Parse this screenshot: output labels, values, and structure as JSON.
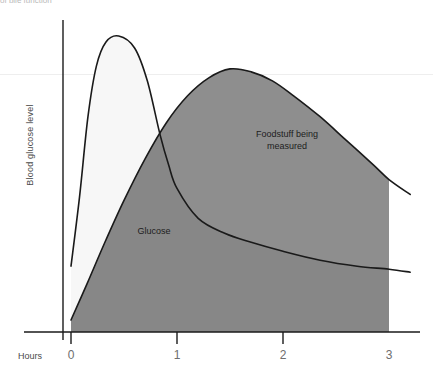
{
  "header": {
    "clipped_text": "of bile function"
  },
  "chart_data": {
    "type": "area",
    "title": "",
    "xlabel": "Hours",
    "ylabel": "Blood glucose level",
    "xlim": [
      -0.08,
      3.2
    ],
    "ylim": [
      0,
      1
    ],
    "grid": false,
    "legend_position": "inline-annotations",
    "xticks": [
      0,
      1,
      2,
      3
    ],
    "xtick_labels": [
      "0",
      "1",
      "2",
      "3"
    ],
    "ytick_labels": [],
    "annotations": [
      {
        "name": "glucose",
        "text": "Glucose",
        "x": 0.36,
        "y": 0.28
      },
      {
        "name": "foodstuff",
        "text": "Foodstuff being\nmeasured",
        "x": 1.68,
        "y": 0.62
      }
    ],
    "series": [
      {
        "name": "Glucose",
        "fill": "#bdbdbd",
        "peak_fill": "#f7f7f7",
        "stroke": "#1a1a1a",
        "x": [
          0.0,
          0.08,
          0.16,
          0.24,
          0.33,
          0.45,
          0.6,
          0.72,
          0.84,
          0.92,
          1.0,
          1.2,
          1.45,
          1.7,
          2.0,
          2.35,
          2.7,
          3.0,
          3.2
        ],
        "y": [
          0.22,
          0.45,
          0.72,
          0.89,
          0.97,
          0.99,
          0.95,
          0.84,
          0.66,
          0.56,
          0.48,
          0.38,
          0.33,
          0.3,
          0.27,
          0.24,
          0.22,
          0.21,
          0.2
        ]
      },
      {
        "name": "Foodstuff being measured",
        "fill": "#808080",
        "stroke": "#1a1a1a",
        "x": [
          0.0,
          0.15,
          0.32,
          0.5,
          0.7,
          0.9,
          1.1,
          1.3,
          1.5,
          1.7,
          1.9,
          2.1,
          2.35,
          2.6,
          2.85,
          3.0,
          3.2
        ],
        "y": [
          0.04,
          0.16,
          0.3,
          0.44,
          0.58,
          0.7,
          0.79,
          0.85,
          0.88,
          0.87,
          0.84,
          0.79,
          0.72,
          0.64,
          0.56,
          0.51,
          0.46
        ]
      }
    ]
  }
}
